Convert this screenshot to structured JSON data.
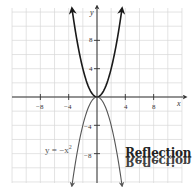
{
  "chart_data": {
    "type": "line",
    "title": "",
    "xlabel": "x",
    "ylabel": "y",
    "xlim": [
      -12,
      12
    ],
    "ylim": [
      -12.4,
      12.6
    ],
    "grid": true,
    "grid_step": 2,
    "x_ticks": [
      -8,
      -4,
      4,
      8
    ],
    "y_ticks": [
      8,
      4,
      -4,
      -8
    ],
    "x_tick_labels": [
      "−8",
      "−4",
      "4",
      "8"
    ],
    "y_tick_labels": [
      "8",
      "4",
      "−4",
      "−8"
    ],
    "series": [
      {
        "name": "y = x^2",
        "function": "x^2",
        "x_domain": [
          -3.5,
          3.5
        ],
        "color": "#1a1a1a",
        "arrows": "both-ends-up"
      },
      {
        "name": "y = -x^2",
        "function": "-x^2",
        "x_domain": [
          -3.52,
          3.52
        ],
        "color": "#555555",
        "arrows": "both-ends-down"
      }
    ],
    "annotations": [
      {
        "text": "y = −x²",
        "at": [
          -8.5,
          -7.5
        ]
      },
      {
        "text": "Reflection",
        "at": [
          6,
          -8.5
        ],
        "style": "mirrored-stamp"
      }
    ],
    "legend": "none"
  },
  "labels": {
    "x_axis": "x",
    "y_axis": "y",
    "ticks_x": [
      "−8",
      "−4",
      "4",
      "8"
    ],
    "ticks_y": [
      "8",
      "4",
      "−4",
      "−8"
    ],
    "equation_main": "y = −x",
    "equation_exp": "2",
    "stamp": "Reflection"
  },
  "colors": {
    "grid": "#d9d9d9",
    "axis": "#333333",
    "curve_upper": "#1a1a1a",
    "curve_lower": "#555555"
  }
}
